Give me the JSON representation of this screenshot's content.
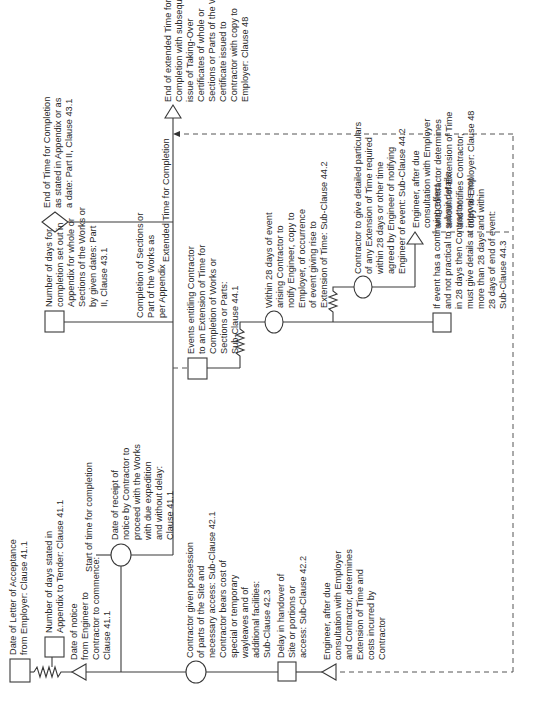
{
  "diagram": {
    "title_hidden": "",
    "orientation": "rotated 90 degrees counter-clockwise",
    "nodes": {
      "letter_of_acceptance": {
        "shape": "square",
        "lines": [
          "Date of Letter of Acceptance",
          "from Employer: Clause 41.1"
        ]
      },
      "days_in_appendix": {
        "shape": "square",
        "lines": [
          "Number of days stated in",
          "Appendix to Tender: Clause 41.1"
        ]
      },
      "notice_to_commence": {
        "shape": "triangle",
        "lines": [
          "Date of notice",
          "from Engineer to",
          "Contractor to commence:",
          "Clause 41.1"
        ]
      },
      "start_time": {
        "shape": "label",
        "lines": [
          "Start of time for completion"
        ]
      },
      "receipt_of_notice": {
        "shape": "circle",
        "lines": [
          "Date of receipt of",
          "notice by Contractor to",
          "proceed with the Works",
          "with due expedition",
          "and without delay:",
          "Clause 41.1"
        ]
      },
      "possession_of_site": {
        "shape": "circle",
        "lines": [
          "Contractor given possession",
          "of parts of the Site and",
          "necessary access: Sub-Clause 42.1",
          "Contractor bears cost of",
          "special or temporary",
          "wayleaves and of",
          "additional facilities:",
          "Sub-Clause 42.3"
        ]
      },
      "delay_in_handover": {
        "shape": "square",
        "lines": [
          "Delay in handover of",
          "Site or portions or",
          "access: Sub-Clause 42.2"
        ]
      },
      "engineer_determines_costs": {
        "shape": "triangle",
        "lines": [
          "Engineer, after due",
          "consultation with Employer",
          "and Contractor, determines",
          "Extension of Time and",
          "costs incurred by",
          "Contractor"
        ]
      },
      "days_for_completion": {
        "shape": "square",
        "lines": [
          "Number of days for",
          "completion set out in",
          "Appendix for whole or",
          "Sections of the Works or",
          "by given dates: Part",
          "II, Clause 43.1"
        ]
      },
      "completion_of_sections": {
        "shape": "label",
        "lines": [
          "Completion of Sections or",
          "Part of the Works as",
          "per Appendix"
        ]
      },
      "end_of_time": {
        "shape": "diamond",
        "lines": [
          "End of Time for Completion",
          "as stated in Appendix or as",
          "a date: Part II, Clause 43.1"
        ]
      },
      "extended_time": {
        "shape": "label",
        "lines": [
          "Extended Time for Completion"
        ]
      },
      "end_of_extended_time": {
        "shape": "triangle",
        "lines": [
          "End of extended Time for",
          "Completion with subsequent",
          "issue of Taking-Over",
          "Certificates of whole or",
          "Sections or Parts of the Work.",
          "Certificate issued to",
          "Contractor with copy to",
          "Employer: Clause 48"
        ]
      },
      "events_entitling": {
        "shape": "square",
        "lines": [
          "Events entitling Contractor",
          "to an Extension of Time for",
          "Completion of Works or",
          "Sections or Parts:",
          "Sub-Clause 44.1"
        ]
      },
      "within_28_days": {
        "shape": "circle",
        "lines": [
          "Within 28 days of event",
          "arising Contractor to",
          "notify Engineer, copy to",
          "Employer, of occurrence",
          "of event giving rise to",
          "Extension of Time: Sub-Clause 44.2"
        ]
      },
      "detailed_particulars": {
        "shape": "circle",
        "lines": [
          "Contractor to give detailed particulars",
          "of any Extension of Time required",
          "within 28 days or other time",
          "agreed by Engineer of notifying",
          "Engineer of event: Sub-Clause 44.2"
        ]
      },
      "continuing_effect": {
        "shape": "square",
        "lines": [
          "If event has a continuing effect",
          "and not practical to submit details",
          "in 28 days then Contractor",
          "must give details at intervals not",
          "more than 28 days and within",
          "28 days of end of event:",
          "Sub-Clause 44.3"
        ]
      },
      "engineer_determines_amount": {
        "shape": "triangle",
        "lines": [
          "Engineer, after due",
          "consultation with Employer",
          "and Contractor determines",
          "amount of Extension of Time",
          "and notifies Contractor,",
          "copy to Employer: Clause 48"
        ]
      }
    }
  }
}
